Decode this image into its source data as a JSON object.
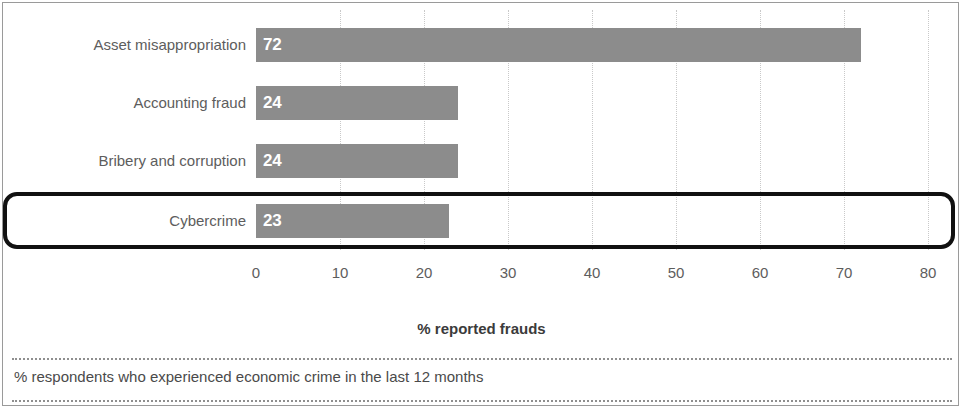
{
  "chart_data": {
    "type": "bar",
    "orientation": "horizontal",
    "title": "",
    "subtitle": "",
    "xlabel": "% reported frauds",
    "ylabel": "",
    "xlim": [
      0,
      80
    ],
    "xticks": [
      0,
      10,
      20,
      30,
      40,
      50,
      60,
      70,
      80
    ],
    "xtick_labels": [
      "0",
      "10",
      "20",
      "30",
      "40",
      "50",
      "60",
      "70",
      "80"
    ],
    "grid": "vertical-dotted",
    "legend": null,
    "bar_color": "#8c8c8c",
    "value_label_color": "#ffffff",
    "categories": [
      "Asset misappropriation",
      "Accounting fraud",
      "Bribery and corruption",
      "Cybercrime"
    ],
    "values": [
      72,
      24,
      24,
      23
    ],
    "value_labels": [
      "72",
      "24",
      "24",
      "23"
    ],
    "highlighted_category": "Cybercrime",
    "highlight_color": "#111111",
    "footnote": "% respondents who experienced economic crime in the last 12 months"
  },
  "axis": {
    "title": "% reported frauds"
  },
  "footnote": {
    "text": "% respondents who experienced economic crime in the last 12 months"
  }
}
